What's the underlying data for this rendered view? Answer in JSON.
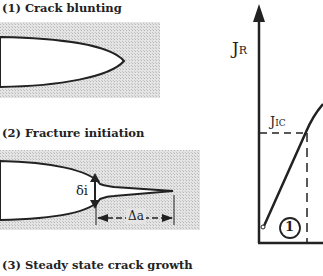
{
  "panels": {
    "step1": {
      "label": "(1)  Crack blunting"
    },
    "step2": {
      "label": "(2)  Fracture initiation",
      "delta_label": "δi",
      "da_label": "Δa"
    },
    "step3": {
      "label": "(3)  Steady state crack growth"
    }
  },
  "graph": {
    "y_axis_label": "J",
    "y_axis_sub": "R",
    "jic_label": "J",
    "jic_sub": "IC",
    "region_marker": "1"
  },
  "colors": {
    "stipple": "#d4d4d4",
    "ink": "#222222"
  }
}
